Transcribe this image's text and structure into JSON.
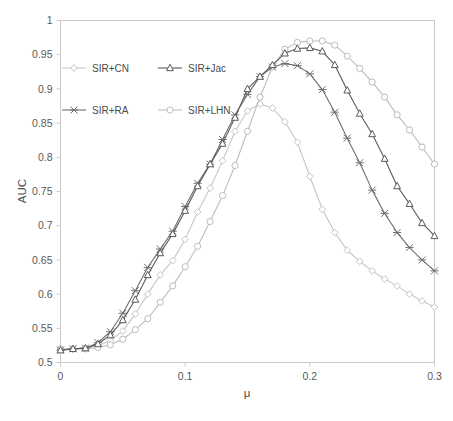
{
  "chart_data": {
    "type": "line",
    "title": "",
    "xlabel": "μ",
    "ylabel": "AUC",
    "xlim": [
      0,
      0.3
    ],
    "ylim": [
      0.5,
      1
    ],
    "xticks": [
      "0",
      "0.1",
      "0.2",
      "0.3"
    ],
    "xtick_values": [
      0,
      0.1,
      0.2,
      0.3
    ],
    "yticks": [
      "0.5",
      "0.55",
      "0.6",
      "0.65",
      "0.7",
      "0.75",
      "0.8",
      "0.85",
      "0.9",
      "0.95",
      "1"
    ],
    "ytick_values": [
      0.5,
      0.55,
      0.6,
      0.65,
      0.7,
      0.75,
      0.8,
      0.85,
      0.9,
      0.95,
      1
    ],
    "grid": false,
    "legend_position": "upper-left-inside",
    "x": [
      0,
      0.01,
      0.02,
      0.03,
      0.04,
      0.05,
      0.06,
      0.07,
      0.08,
      0.09,
      0.1,
      0.11,
      0.12,
      0.13,
      0.14,
      0.15,
      0.16,
      0.17,
      0.18,
      0.19,
      0.2,
      0.21,
      0.22,
      0.23,
      0.24,
      0.25,
      0.26,
      0.27,
      0.28,
      0.29,
      0.3
    ],
    "series": [
      {
        "name": "SIR+CN",
        "color": "#c6c6c6",
        "marker": "diamond",
        "values": [
          0.518,
          0.519,
          0.52,
          0.524,
          0.532,
          0.546,
          0.571,
          0.6,
          0.628,
          0.649,
          0.68,
          0.72,
          0.755,
          0.795,
          0.838,
          0.868,
          0.878,
          0.872,
          0.852,
          0.822,
          0.772,
          0.724,
          0.69,
          0.664,
          0.648,
          0.634,
          0.622,
          0.612,
          0.6,
          0.59,
          0.581
        ]
      },
      {
        "name": "SIR+Jac",
        "color": "#5a5a5a",
        "marker": "triangle",
        "values": [
          0.518,
          0.52,
          0.521,
          0.527,
          0.54,
          0.562,
          0.592,
          0.628,
          0.66,
          0.688,
          0.722,
          0.758,
          0.79,
          0.82,
          0.858,
          0.9,
          0.918,
          0.935,
          0.952,
          0.959,
          0.96,
          0.955,
          0.935,
          0.898,
          0.864,
          0.834,
          0.798,
          0.758,
          0.732,
          0.704,
          0.685
        ]
      },
      {
        "name": "SIR+RA",
        "color": "#6f6f6f",
        "marker": "cross",
        "values": [
          0.518,
          0.52,
          0.521,
          0.529,
          0.545,
          0.572,
          0.605,
          0.639,
          0.666,
          0.692,
          0.728,
          0.762,
          0.79,
          0.826,
          0.862,
          0.892,
          0.918,
          0.932,
          0.937,
          0.934,
          0.922,
          0.899,
          0.866,
          0.828,
          0.792,
          0.752,
          0.718,
          0.69,
          0.668,
          0.65,
          0.634
        ]
      },
      {
        "name": "SIR+LHN",
        "color": "#bdbdbd",
        "marker": "circle",
        "values": [
          0.52,
          0.52,
          0.52,
          0.522,
          0.526,
          0.534,
          0.548,
          0.564,
          0.588,
          0.612,
          0.64,
          0.67,
          0.706,
          0.744,
          0.788,
          0.838,
          0.888,
          0.932,
          0.958,
          0.968,
          0.97,
          0.97,
          0.964,
          0.948,
          0.93,
          0.91,
          0.888,
          0.862,
          0.84,
          0.815,
          0.79
        ]
      }
    ]
  },
  "legend": {
    "entries": [
      {
        "label": "SIR+CN"
      },
      {
        "label": "SIR+Jac"
      },
      {
        "label": "SIR+RA"
      },
      {
        "label": "SIR+LHN"
      }
    ]
  },
  "axes": {
    "y_title": "AUC",
    "x_title": "μ"
  }
}
